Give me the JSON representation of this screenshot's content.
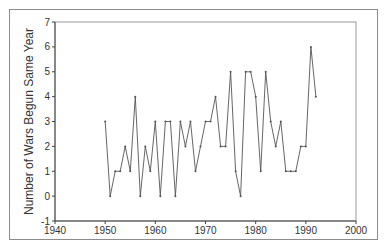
{
  "chart_data": {
    "type": "line",
    "title": "",
    "xlabel": "",
    "ylabel": "Number of Wars Begun Same Year",
    "xlim": [
      1940,
      2000
    ],
    "ylim": [
      -1,
      7
    ],
    "x_ticks": [
      1940,
      1950,
      1960,
      1970,
      1980,
      1990,
      2000
    ],
    "y_ticks": [
      -1,
      0,
      1,
      2,
      3,
      4,
      5,
      6,
      7
    ],
    "grid": false,
    "legend": null,
    "x": [
      1950,
      1951,
      1952,
      1953,
      1954,
      1955,
      1956,
      1957,
      1958,
      1959,
      1960,
      1961,
      1962,
      1963,
      1964,
      1965,
      1966,
      1967,
      1968,
      1969,
      1970,
      1971,
      1972,
      1973,
      1974,
      1975,
      1976,
      1977,
      1978,
      1979,
      1980,
      1981,
      1982,
      1983,
      1984,
      1985,
      1986,
      1987,
      1988,
      1989,
      1990,
      1991,
      1992
    ],
    "values": [
      3,
      0,
      1,
      1,
      2,
      1,
      4,
      0,
      2,
      1,
      3,
      0,
      3,
      3,
      0,
      3,
      2,
      3,
      1,
      2,
      3,
      3,
      4,
      2,
      2,
      5,
      1,
      0,
      5,
      5,
      4,
      1,
      5,
      3,
      2,
      3,
      1,
      1,
      1,
      2,
      2,
      6,
      4
    ]
  },
  "colors": {
    "line": "#555555",
    "axis": "#444444",
    "frame": "#8c8c8c"
  }
}
